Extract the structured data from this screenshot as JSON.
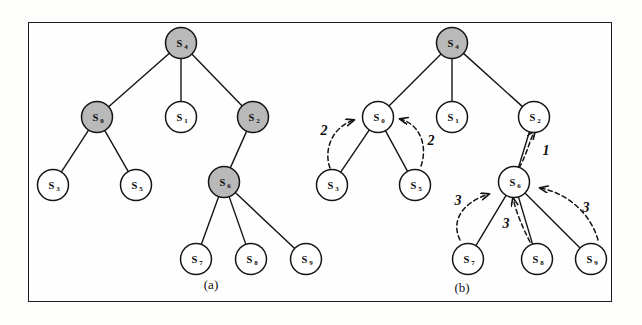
{
  "figure": {
    "caption_a": "(a)",
    "caption_b": "(b)",
    "frame_color": "#1b1b1b",
    "shaded_node_color": "#b9b9b9",
    "hollow_node_color": "#ffffff",
    "stroke_color": "#141414"
  },
  "panel_a": {
    "caption": "(a)",
    "nodes": [
      {
        "id": "a-s4",
        "label": "S",
        "sub": "4",
        "shaded": true,
        "cx": 181,
        "cy": 43
      },
      {
        "id": "a-s0",
        "label": "S",
        "sub": "0",
        "shaded": true,
        "cx": 97,
        "cy": 117
      },
      {
        "id": "a-s1",
        "label": "S",
        "sub": "1",
        "shaded": false,
        "cx": 181,
        "cy": 117
      },
      {
        "id": "a-s2",
        "label": "S",
        "sub": "2",
        "shaded": true,
        "cx": 253,
        "cy": 117
      },
      {
        "id": "a-s3",
        "label": "S",
        "sub": "3",
        "shaded": false,
        "cx": 53,
        "cy": 185
      },
      {
        "id": "a-s5",
        "label": "S",
        "sub": "5",
        "shaded": false,
        "cx": 136,
        "cy": 185
      },
      {
        "id": "a-s6",
        "label": "S",
        "sub": "6",
        "shaded": true,
        "cx": 224,
        "cy": 182
      },
      {
        "id": "a-s7",
        "label": "S",
        "sub": "7",
        "shaded": false,
        "cx": 196,
        "cy": 259
      },
      {
        "id": "a-s8",
        "label": "S",
        "sub": "8",
        "shaded": false,
        "cx": 251,
        "cy": 259
      },
      {
        "id": "a-s9",
        "label": "S",
        "sub": "9",
        "shaded": false,
        "cx": 306,
        "cy": 259
      }
    ],
    "edges": [
      {
        "from": "a-s4",
        "to": "a-s0"
      },
      {
        "from": "a-s4",
        "to": "a-s1"
      },
      {
        "from": "a-s4",
        "to": "a-s2"
      },
      {
        "from": "a-s0",
        "to": "a-s3"
      },
      {
        "from": "a-s0",
        "to": "a-s5"
      },
      {
        "from": "a-s2",
        "to": "a-s6"
      },
      {
        "from": "a-s6",
        "to": "a-s7"
      },
      {
        "from": "a-s6",
        "to": "a-s8"
      },
      {
        "from": "a-s6",
        "to": "a-s9"
      }
    ]
  },
  "panel_b": {
    "caption": "(b)",
    "nodes": [
      {
        "id": "b-s4",
        "label": "S",
        "sub": "4",
        "shaded": true,
        "cx": 452,
        "cy": 43
      },
      {
        "id": "b-s0",
        "label": "S",
        "sub": "0",
        "shaded": false,
        "cx": 378,
        "cy": 117
      },
      {
        "id": "b-s1",
        "label": "S",
        "sub": "1",
        "shaded": false,
        "cx": 452,
        "cy": 117
      },
      {
        "id": "b-s2",
        "label": "S",
        "sub": "2",
        "shaded": false,
        "cx": 534,
        "cy": 117
      },
      {
        "id": "b-s3",
        "label": "S",
        "sub": "3",
        "shaded": false,
        "cx": 332,
        "cy": 185
      },
      {
        "id": "b-s5",
        "label": "S",
        "sub": "5",
        "shaded": false,
        "cx": 415,
        "cy": 185
      },
      {
        "id": "b-s6",
        "label": "S",
        "sub": "6",
        "shaded": false,
        "cx": 514,
        "cy": 182
      },
      {
        "id": "b-s7",
        "label": "S",
        "sub": "7",
        "shaded": false,
        "cx": 468,
        "cy": 259
      },
      {
        "id": "b-s8",
        "label": "S",
        "sub": "8",
        "shaded": false,
        "cx": 537,
        "cy": 259
      },
      {
        "id": "b-s9",
        "label": "S",
        "sub": "9",
        "shaded": false,
        "cx": 591,
        "cy": 259
      }
    ],
    "edges": [
      {
        "from": "b-s4",
        "to": "b-s0"
      },
      {
        "from": "b-s4",
        "to": "b-s1"
      },
      {
        "from": "b-s4",
        "to": "b-s2"
      },
      {
        "from": "b-s0",
        "to": "b-s3"
      },
      {
        "from": "b-s0",
        "to": "b-s5"
      },
      {
        "from": "b-s2",
        "to": "b-s6"
      },
      {
        "from": "b-s6",
        "to": "b-s7"
      },
      {
        "from": "b-s6",
        "to": "b-s8"
      },
      {
        "from": "b-s6",
        "to": "b-s9"
      }
    ],
    "message_arrows": [
      {
        "id": "arrow-s3-to-s0",
        "label": "2",
        "from": "b-s3",
        "to": "b-s0",
        "path": "M 330 168 C 324 152 330 128 354 120",
        "label_x": 324,
        "label_y": 135
      },
      {
        "id": "arrow-s5-to-s0",
        "label": "2",
        "from": "b-s5",
        "to": "b-s0",
        "path": "M 421 166 C 428 146 420 124 400 119",
        "label_x": 431,
        "label_y": 145
      },
      {
        "id": "arrow-s6-to-s2",
        "label": "1",
        "from": "b-s6",
        "to": "b-s2",
        "path": "M 519 168 C 528 152 530 138 535 131",
        "label_x": 546,
        "label_y": 155
      },
      {
        "id": "arrow-s7-to-s6",
        "label": "3",
        "from": "b-s7",
        "to": "b-s6",
        "path": "M 460 240 C 452 224 458 204 489 194",
        "label_x": 458,
        "label_y": 205
      },
      {
        "id": "arrow-s8-to-s6",
        "label": "3",
        "from": "b-s8",
        "to": "b-s6",
        "path": "M 530 242 C 522 226 516 212 513 198",
        "label_x": 506,
        "label_y": 228
      },
      {
        "id": "arrow-s9-to-s6",
        "label": "3",
        "from": "b-s9",
        "to": "b-s6",
        "path": "M 598 240 C 592 218 572 194 540 188",
        "label_x": 586,
        "label_y": 212
      }
    ]
  }
}
